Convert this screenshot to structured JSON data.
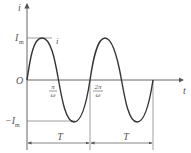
{
  "diagram": {
    "type": "sinusoidal-current-waveform",
    "axes": {
      "y_label": "i",
      "x_label": "t",
      "origin_label": "O"
    },
    "levels": {
      "positive_peak": "I",
      "positive_peak_sub": "m",
      "negative_peak_prefix": "−I",
      "negative_peak_sub": "m"
    },
    "curve_label": "i",
    "ticks": [
      {
        "num": "π",
        "den": "ω"
      },
      {
        "num": "2π",
        "den": "ω"
      }
    ],
    "periods": [
      {
        "label": "T"
      },
      {
        "label": "T"
      }
    ],
    "colors": {
      "curve": "#333333",
      "axis": "#555555",
      "guide": "#777777"
    }
  }
}
